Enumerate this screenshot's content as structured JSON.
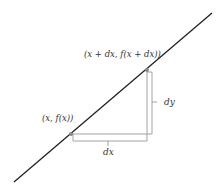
{
  "diagram": {
    "type": "secant-derivative-illustration",
    "labels": {
      "upper_point": "(x + dx, f(x + dx))",
      "lower_point": "(x, f(x))",
      "vertical_delta": "dy",
      "horizontal_delta": "dx"
    },
    "colors": {
      "line": "#222222",
      "bracket": "#999999",
      "point": "#888888",
      "text": "#333333"
    }
  }
}
